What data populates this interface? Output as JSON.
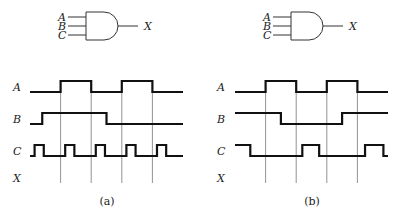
{
  "panels": [
    {
      "caption": "(a)",
      "gate": {
        "type": "AND",
        "inputs": [
          "A",
          "B",
          "C"
        ],
        "output": "X"
      },
      "time_range": [
        0,
        10
      ],
      "gridlines": [
        2,
        4,
        6,
        8
      ],
      "signals": [
        {
          "name": "A",
          "initial": 0,
          "transitions": [
            2,
            4,
            6,
            8
          ]
        },
        {
          "name": "B",
          "initial": 0,
          "transitions": [
            0.8,
            5
          ]
        },
        {
          "name": "C",
          "initial": 0,
          "transitions": [
            0.3,
            0.9,
            2.3,
            2.9,
            4.3,
            4.9,
            6.3,
            6.9,
            8.3,
            8.9
          ]
        },
        {
          "name": "X",
          "initial": null,
          "transitions": []
        }
      ]
    },
    {
      "caption": "(b)",
      "gate": {
        "type": "AND",
        "inputs": [
          "A",
          "B",
          "C"
        ],
        "output": "X"
      },
      "time_range": [
        0,
        10
      ],
      "gridlines": [
        2,
        4,
        6,
        8
      ],
      "signals": [
        {
          "name": "A",
          "initial": 0,
          "transitions": [
            2,
            4,
            6,
            8
          ]
        },
        {
          "name": "B",
          "initial": 1,
          "transitions": [
            3,
            7
          ]
        },
        {
          "name": "C",
          "initial": 1,
          "transitions": [
            1,
            4.4,
            5.5,
            8.5,
            9.7
          ]
        },
        {
          "name": "X",
          "initial": null,
          "transitions": []
        }
      ]
    }
  ]
}
